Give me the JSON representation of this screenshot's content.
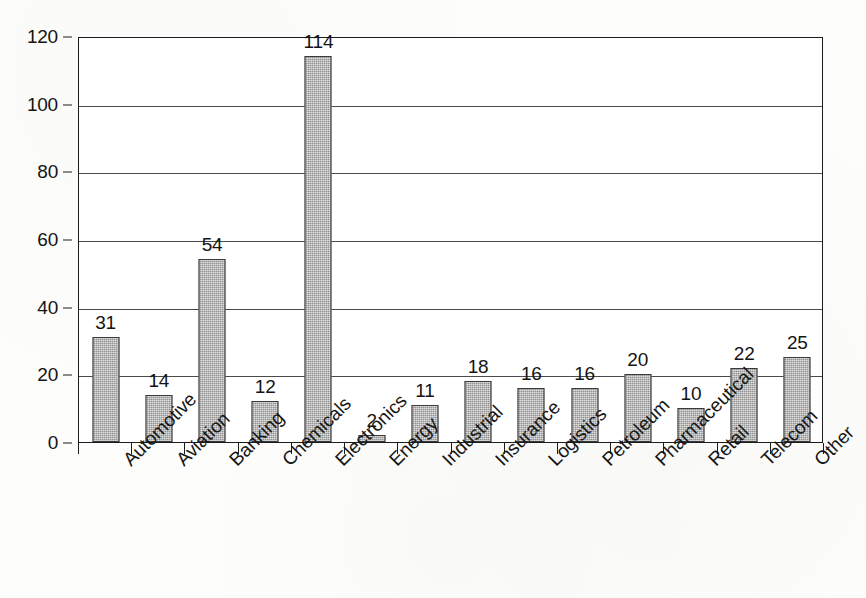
{
  "chart_data": {
    "type": "bar",
    "title": "",
    "subtitle": "",
    "xlabel": "",
    "ylabel": "",
    "ylim": [
      0,
      120
    ],
    "y_ticks": [
      0,
      20,
      40,
      60,
      80,
      100,
      120
    ],
    "grid": true,
    "legend": "none",
    "orientation": "vertical",
    "bar_color": "#a3a3a3",
    "bar_border_color": "#3a3a3a",
    "axis_color": "#1c1c1c",
    "gridline_color": "#4a4a4a",
    "background_color": "#fdfdfb",
    "x_tick_label_rotation": -45,
    "data_labels_shown": true,
    "categories": [
      "Automotive",
      "Aviation",
      "Banking",
      "Chemicals",
      "Electronics",
      "Energy",
      "Industrial",
      "Insurance",
      "Logistics",
      "Petroleum",
      "Pharmaceutical",
      "Retail",
      "Telecom",
      "Other"
    ],
    "values": [
      31,
      14,
      54,
      12,
      114,
      2,
      11,
      18,
      16,
      16,
      20,
      10,
      22,
      25
    ],
    "labels": [
      "31",
      "14",
      "54",
      "12",
      "114",
      "2",
      "11",
      "18",
      "16",
      "16",
      "20",
      "10",
      "22",
      "25"
    ]
  }
}
